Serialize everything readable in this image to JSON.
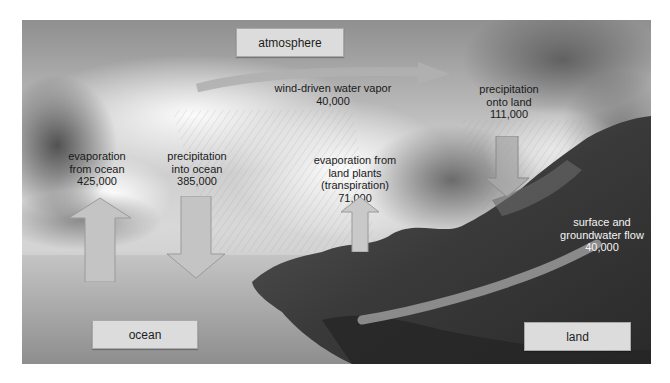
{
  "diagram": {
    "type": "water-cycle",
    "style": "grayscale-photo-background",
    "regions": {
      "atmosphere": "atmosphere",
      "ocean": "ocean",
      "land": "land"
    },
    "flows": {
      "wind_vapor": {
        "label": "wind-driven water vapor",
        "value": "40,000",
        "direction": "ocean-to-land"
      },
      "evap_ocean": {
        "line1": "evaporation",
        "line2": "from ocean",
        "value": "425,000",
        "direction": "up"
      },
      "precip_ocean": {
        "line1": "precipitation",
        "line2": "into ocean",
        "value": "385,000",
        "direction": "down"
      },
      "transpiration": {
        "line1": "evaporation from",
        "line2": "land plants",
        "line3": "(transpiration)",
        "value": "71,000",
        "direction": "up"
      },
      "precip_land": {
        "line1": "precipitation",
        "line2": "onto land",
        "value": "111,000",
        "direction": "down"
      },
      "runoff": {
        "line1": "surface and",
        "line2": "groundwater flow",
        "value": "40,000",
        "direction": "land-to-ocean"
      }
    },
    "colors": {
      "label_box_fill": "#dcdcdc",
      "arrow_fill": "#c4c4c4",
      "text_dark": "#1a1a1a",
      "text_light": "#f4f4f4"
    }
  }
}
